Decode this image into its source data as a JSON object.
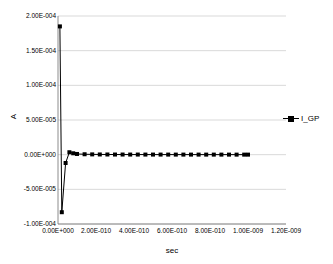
{
  "chart_data": {
    "type": "line",
    "title": "",
    "xlabel": "sec",
    "ylabel": "A",
    "xlim": [
      0.0,
      1.2e-09
    ],
    "ylim": [
      -0.0001,
      0.0002
    ],
    "grid": true,
    "grid_axis": "y",
    "legend_position": "right",
    "x_tick_labels": [
      "0.00E+000",
      "2.00E-010",
      "4.00E-010",
      "6.00E-010",
      "8.00E-010",
      "1.00E-009",
      "1.20E-009"
    ],
    "x_tick_values": [
      0.0,
      2e-10,
      4e-10,
      6e-10,
      8e-10,
      1e-09,
      1.2e-09
    ],
    "y_tick_labels": [
      "2.00E-004",
      "1.50E-004",
      "1.00E-004",
      "5.00E-005",
      "0.00E+000",
      "-5.00E-005",
      "-1.00E-004"
    ],
    "y_tick_values": [
      0.0002,
      0.00015,
      0.0001,
      5e-05,
      0.0,
      -5e-05,
      -0.0001
    ],
    "series": [
      {
        "name": "I_GP",
        "marker": "square",
        "color": "#000000",
        "x": [
          1e-11,
          2e-11,
          4e-11,
          6e-11,
          8e-11,
          1e-10,
          1.4e-10,
          1.8e-10,
          2.2e-10,
          2.6e-10,
          3e-10,
          3.4e-10,
          3.8e-10,
          4.2e-10,
          4.6e-10,
          5e-10,
          5.4e-10,
          5.8e-10,
          6.2e-10,
          6.6e-10,
          7e-10,
          7.4e-10,
          7.8e-10,
          8.2e-10,
          8.6e-10,
          9e-10,
          9.4e-10,
          9.8e-10,
          1e-09
        ],
        "y": [
          0.000185,
          -8.3e-05,
          -1.2e-05,
          3.5e-06,
          2e-06,
          1e-06,
          6e-07,
          4e-07,
          3e-07,
          2.5e-07,
          2e-07,
          1.8e-07,
          1.6e-07,
          1.5e-07,
          1.4e-07,
          1.3e-07,
          1.2e-07,
          1.1e-07,
          1e-07,
          1e-07,
          9e-08,
          9e-08,
          8e-08,
          8e-08,
          7e-08,
          7e-08,
          6e-08,
          6e-08,
          6e-08
        ]
      }
    ]
  },
  "legend": {
    "items": [
      {
        "label": "I_GP"
      }
    ]
  },
  "axes": {
    "y_title": "A",
    "x_title": "sec"
  }
}
